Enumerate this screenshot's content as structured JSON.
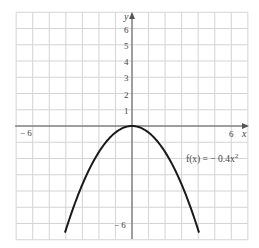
{
  "chart_data": {
    "type": "line",
    "title": "",
    "xlabel": "x",
    "ylabel": "y",
    "xlim": [
      -7,
      7
    ],
    "ylim": [
      -7,
      7
    ],
    "grid": true,
    "x_tick_labels": [
      {
        "value": -6,
        "label": "− 6"
      },
      {
        "value": 6,
        "label": "6"
      }
    ],
    "y_tick_labels": [
      {
        "value": 1,
        "label": "1"
      },
      {
        "value": 2,
        "label": "2"
      },
      {
        "value": 3,
        "label": "3"
      },
      {
        "value": 4,
        "label": "4"
      },
      {
        "value": 5,
        "label": "5"
      },
      {
        "value": 6,
        "label": "6"
      },
      {
        "value": -6,
        "label": "− 6"
      }
    ],
    "series": [
      {
        "name": "f(x) = −0.4x²",
        "expression": "-0.4*x^2",
        "x_range": [
          -4.05,
          4.05
        ],
        "x": [
          -4,
          -3,
          -2,
          -1,
          0,
          1,
          2,
          3,
          4
        ],
        "values": [
          -6.4,
          -3.6,
          -1.6,
          -0.4,
          0,
          -0.4,
          -1.6,
          -3.6,
          -6.4
        ]
      }
    ],
    "annotations": [
      {
        "text": "f(x) = − 0.4x²",
        "x": 3.3,
        "y": -2
      }
    ]
  },
  "labels": {
    "x_axis": "x",
    "y_axis": "y",
    "x_neg6": "− 6",
    "x_pos6": "6",
    "y_neg6": "− 6",
    "y_ticks": [
      "1",
      "2",
      "3",
      "4",
      "5",
      "6"
    ],
    "function_prefix": "f(x) = − 0.4x",
    "function_exp": "2"
  }
}
